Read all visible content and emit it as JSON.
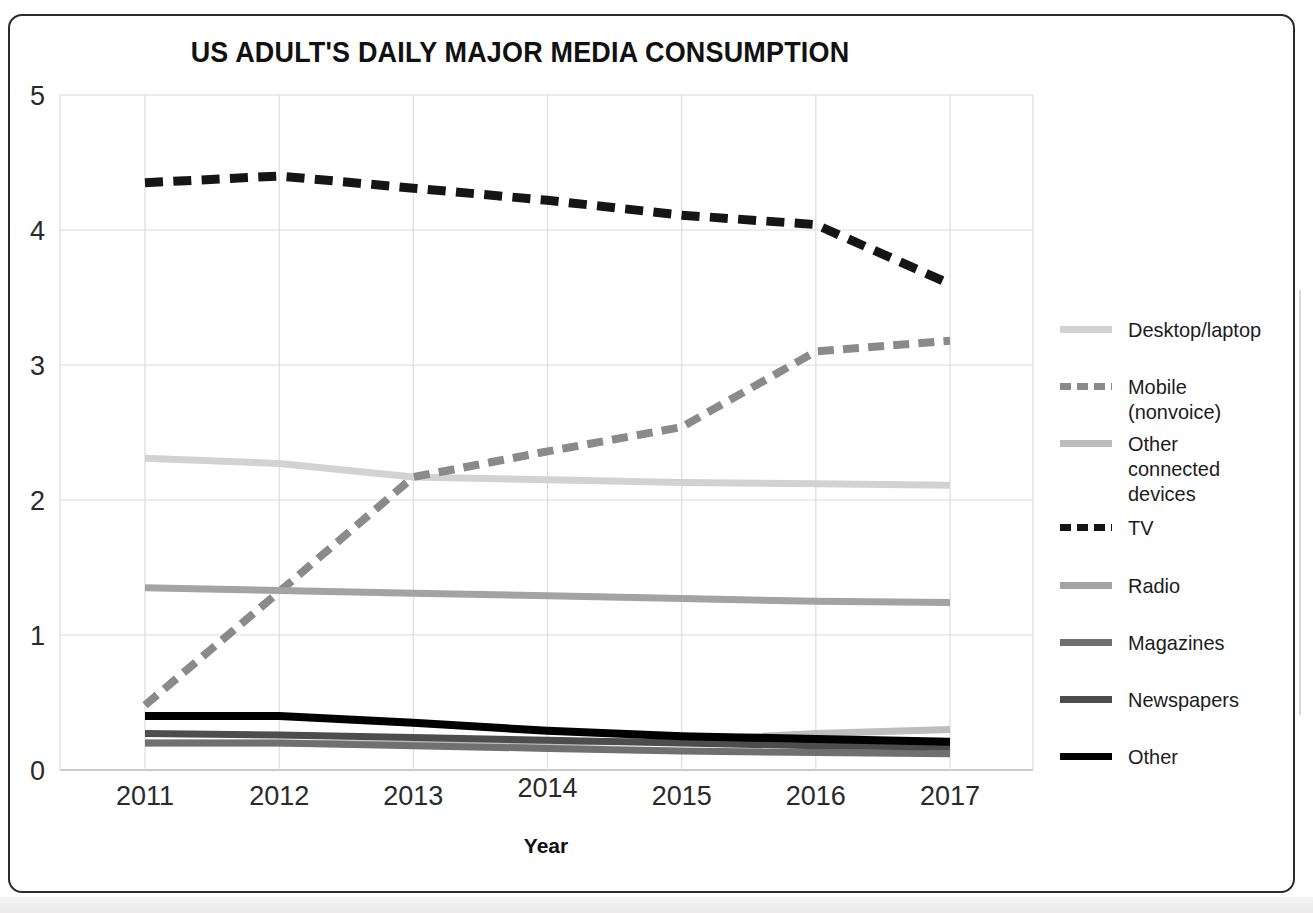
{
  "figure": {
    "title": "US ADULT'S DAILY MAJOR MEDIA CONSUMPTION",
    "border_color": "#2b2b2b",
    "background": "#ffffff"
  },
  "chart_data": {
    "type": "line",
    "title": "US ADULT'S DAILY MAJOR MEDIA CONSUMPTION",
    "xlabel": "Year",
    "ylabel": "",
    "categories": [
      "2011",
      "2012",
      "2013",
      "2014",
      "2015",
      "2016",
      "2017"
    ],
    "x": [
      2011,
      2012,
      2013,
      2014,
      2015,
      2016,
      2017
    ],
    "xlim": [
      2010.4,
      2018.2
    ],
    "ylim": [
      0,
      5
    ],
    "yticks": [
      "0",
      "1",
      "2",
      "3",
      "4",
      "5"
    ],
    "ytick_values": [
      0,
      1,
      2,
      3,
      4,
      5
    ],
    "grid": true,
    "legend_position": "right",
    "series": [
      {
        "name": "Desktop/laptop",
        "color": "#d2d2d2",
        "style": "solid",
        "width": 7,
        "values": [
          2.31,
          2.27,
          2.17,
          2.15,
          2.13,
          2.12,
          2.11
        ]
      },
      {
        "name": "Mobile (nonvoice)",
        "color": "#8a8a8a",
        "style": "dashed",
        "width": 8,
        "values": [
          0.48,
          1.32,
          2.17,
          2.36,
          2.54,
          3.1,
          3.18
        ]
      },
      {
        "name": "Other connected\ndevices",
        "color": "#bdbdbd",
        "style": "solid",
        "width": 7,
        "values": [
          0.2,
          0.2,
          0.19,
          0.2,
          0.22,
          0.27,
          0.3
        ]
      },
      {
        "name": "TV",
        "color": "#151515",
        "style": "dashed",
        "width": 9,
        "values": [
          4.35,
          4.4,
          4.31,
          4.22,
          4.11,
          4.04,
          3.6
        ]
      },
      {
        "name": "Radio",
        "color": "#a3a3a3",
        "style": "solid",
        "width": 7,
        "values": [
          1.35,
          1.33,
          1.31,
          1.29,
          1.27,
          1.25,
          1.24
        ]
      },
      {
        "name": "Magazines",
        "color": "#707070",
        "style": "solid",
        "width": 7,
        "values": [
          0.2,
          0.2,
          0.18,
          0.16,
          0.14,
          0.13,
          0.12
        ]
      },
      {
        "name": "Newspapers",
        "color": "#4d4d4d",
        "style": "solid",
        "width": 7,
        "values": [
          0.27,
          0.26,
          0.24,
          0.22,
          0.2,
          0.18,
          0.17
        ]
      },
      {
        "name": "Other",
        "color": "#000000",
        "style": "solid",
        "width": 8,
        "values": [
          0.4,
          0.4,
          0.35,
          0.29,
          0.25,
          0.23,
          0.21
        ]
      }
    ]
  },
  "legend": {
    "items": [
      {
        "label": "Desktop/laptop",
        "color": "#d2d2d2",
        "style": "solid"
      },
      {
        "label": "Mobile (nonvoice)",
        "color": "#8a8a8a",
        "style": "dashed"
      },
      {
        "label": "Other connected\ndevices",
        "color": "#bdbdbd",
        "style": "solid"
      },
      {
        "label": "TV",
        "color": "#151515",
        "style": "dashed"
      },
      {
        "label": "Radio",
        "color": "#a3a3a3",
        "style": "solid"
      },
      {
        "label": "Magazines",
        "color": "#707070",
        "style": "solid"
      },
      {
        "label": "Newspapers",
        "color": "#4d4d4d",
        "style": "solid"
      },
      {
        "label": "Other",
        "color": "#000000",
        "style": "solid"
      }
    ]
  }
}
